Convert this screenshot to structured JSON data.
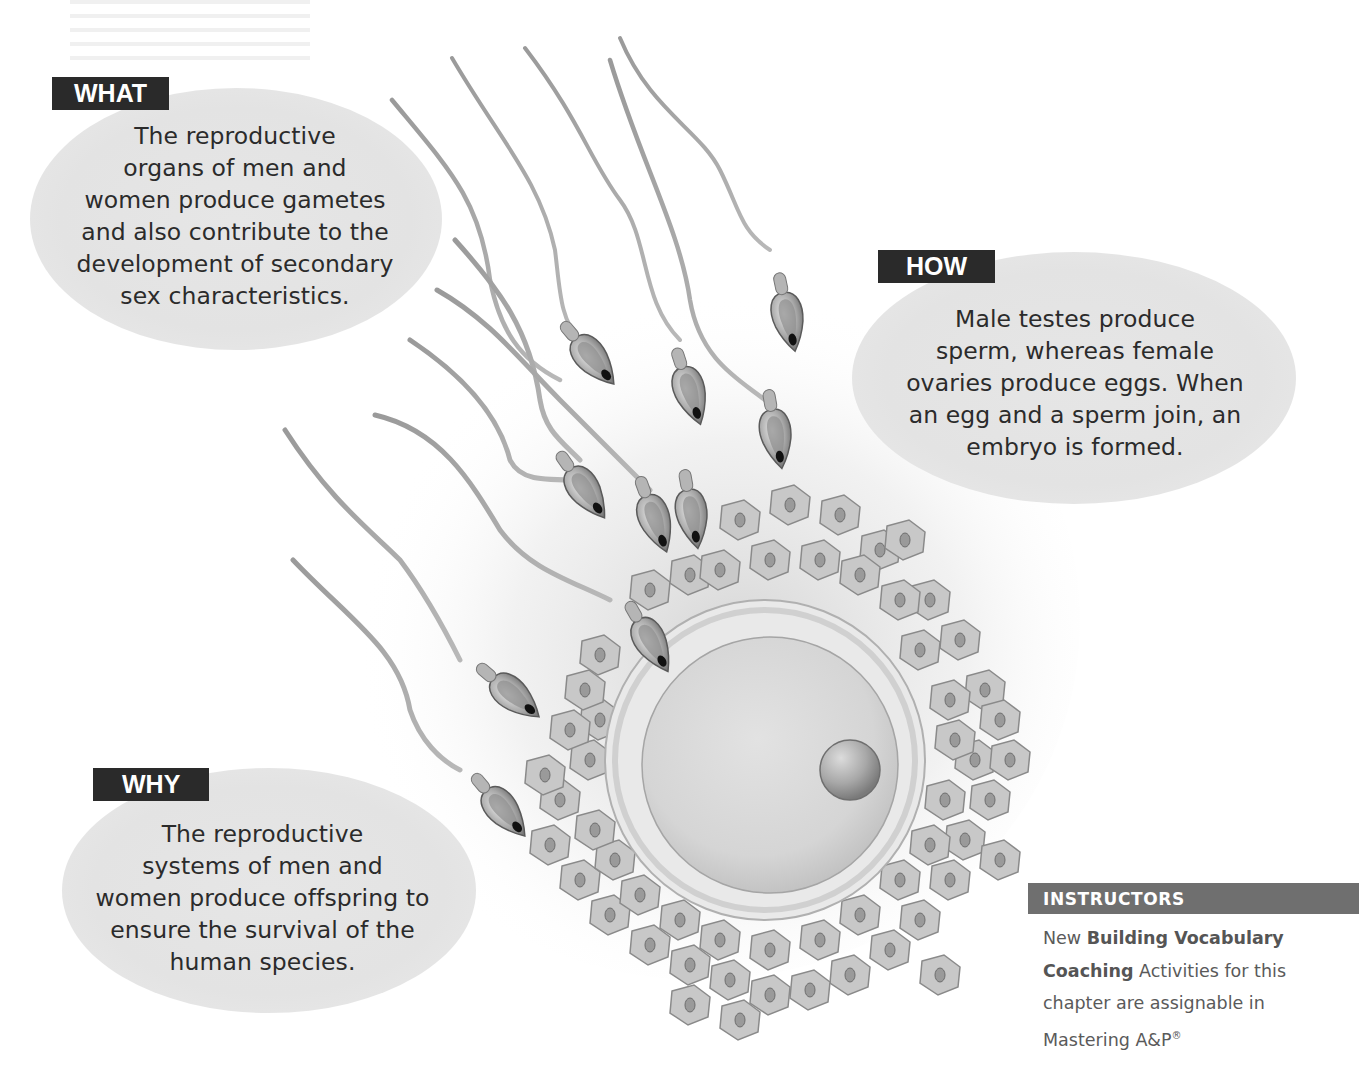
{
  "callouts": {
    "what": {
      "label": "WHAT",
      "lines": [
        "The reproductive",
        "organs of men and",
        "women produce gametes",
        "and also contribute to the",
        "development of secondary",
        "sex characteristics."
      ]
    },
    "how": {
      "label": "HOW",
      "lines": [
        "Male testes produce",
        "sperm, whereas female",
        "ovaries produce eggs. When",
        "an egg and a sperm join, an",
        "embryo is formed."
      ]
    },
    "why": {
      "label": "WHY",
      "lines": [
        "The reproductive",
        "systems of men and",
        "women produce offspring to",
        "ensure the survival of the",
        "human species."
      ]
    }
  },
  "illustration": {
    "subject": "sperm cells approaching an egg (oocyte) surrounded by corona radiata cells",
    "elements": [
      "sperm",
      "oocyte",
      "zona-pellucida",
      "corona-radiata-cells",
      "nucleus"
    ],
    "colors": {
      "tone": "#bdbdbd",
      "dark": "#1a1a1a",
      "cell": "#c9c9c9",
      "egg": "#d8d8d8"
    }
  },
  "instructors": {
    "title": "INSTRUCTORS",
    "line1_prefix": "New ",
    "line1_bold": "Building Vocabulary",
    "line2_bold": "Coaching",
    "line2_rest": " Activities for this",
    "line3": "chapter are assignable in",
    "line4": "Mastering A&P",
    "line4_mark": "®"
  }
}
